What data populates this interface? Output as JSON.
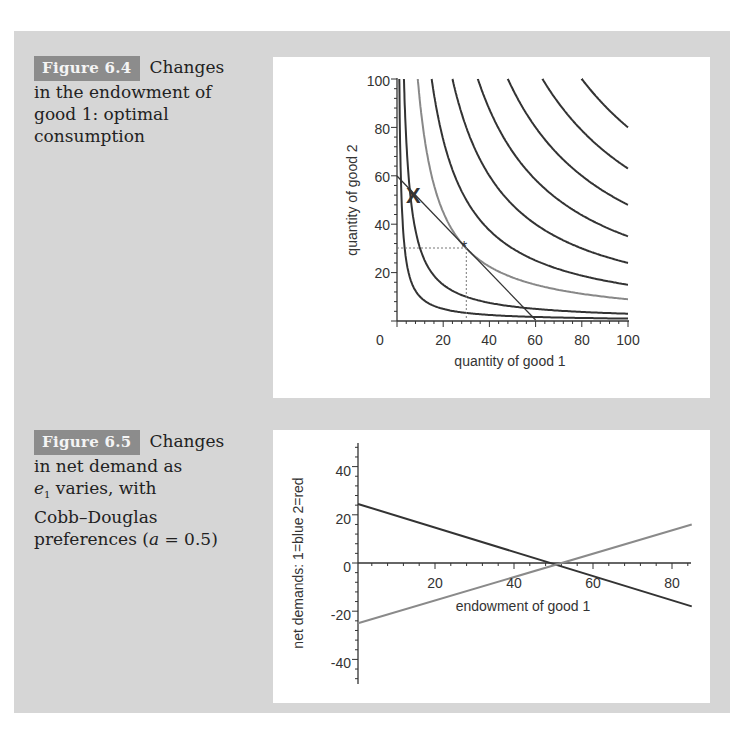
{
  "figures": [
    {
      "label": "Figure 6.4",
      "caption_first": "Changes",
      "caption_rest": "in the endowment of good 1: optimal consumption",
      "caption_lines": [
        "in the endowment of",
        "good 1: optimal",
        "consumption"
      ]
    },
    {
      "label": "Figure 6.5",
      "caption_first": "Changes",
      "caption_lines": [
        "in net demand as",
        "varies, with",
        "Cobb–Douglas",
        "preferences ("
      ],
      "caption_var": "e",
      "caption_sub": "1",
      "caption_param": "a",
      "caption_param_value": " = 0.5)"
    }
  ],
  "chart_data": [
    {
      "type": "line",
      "title": "Figure 6.4 Changes in the endowment of good 1: optimal consumption",
      "xlabel": "quantity of good 1",
      "ylabel": "quantity of good 2",
      "xlim": [
        0,
        100
      ],
      "ylim": [
        0,
        100
      ],
      "xticks": [
        "0",
        "20",
        "40",
        "60",
        "80",
        "100"
      ],
      "yticks": [
        "20",
        "40",
        "60",
        "80",
        "100"
      ],
      "grid": false,
      "series": [
        {
          "name": "indifference curve k=100",
          "formula": "x*y=100",
          "color": "#333333"
        },
        {
          "name": "indifference curve k=300",
          "formula": "x*y=300",
          "color": "#333333"
        },
        {
          "name": "indifference curve k=900 (optimal, highlighted)",
          "formula": "x*y=900",
          "color": "#888888"
        },
        {
          "name": "indifference curve k=1500",
          "formula": "x*y=1500",
          "color": "#333333"
        },
        {
          "name": "indifference curve k=2400",
          "formula": "x*y=2400",
          "color": "#333333"
        },
        {
          "name": "indifference curve k=3500",
          "formula": "x*y=3500",
          "color": "#333333"
        },
        {
          "name": "indifference curve k=4800",
          "formula": "x*y=4800",
          "color": "#333333"
        },
        {
          "name": "indifference curve k=6300",
          "formula": "x*y=6300",
          "color": "#333333"
        },
        {
          "name": "indifference curve k=8000",
          "formula": "x*y=8000",
          "color": "#333333"
        },
        {
          "name": "budget line",
          "x": [
            0,
            60
          ],
          "y": [
            60,
            0
          ],
          "color": "#333333"
        }
      ],
      "annotations": [
        {
          "marker": "X",
          "label": "endowment",
          "x": 8,
          "y": 52
        },
        {
          "marker": "*",
          "label": "optimum",
          "x": 30,
          "y": 30,
          "guides": "dotted"
        }
      ]
    },
    {
      "type": "line",
      "title": "Figure 6.5 Changes in net demand as e1 varies, with Cobb–Douglas preferences (a = 0.5)",
      "xlabel": "endowment of good 1",
      "ylabel": "net demands: 1=blue 2=red",
      "xlim": [
        0,
        85
      ],
      "ylim": [
        -50,
        50
      ],
      "xticks": [
        "20",
        "40",
        "60",
        "80"
      ],
      "yticks": [
        "-40",
        "-20",
        "0",
        "20",
        "40"
      ],
      "grid": false,
      "series": [
        {
          "name": "net demand good 1 (blue)",
          "x": [
            0,
            85
          ],
          "y": [
            24.5,
            -18
          ],
          "color": "#333333"
        },
        {
          "name": "net demand good 2 (red)",
          "x": [
            0,
            85
          ],
          "y": [
            -25,
            16
          ],
          "color": "#8a8a8a"
        }
      ]
    }
  ]
}
